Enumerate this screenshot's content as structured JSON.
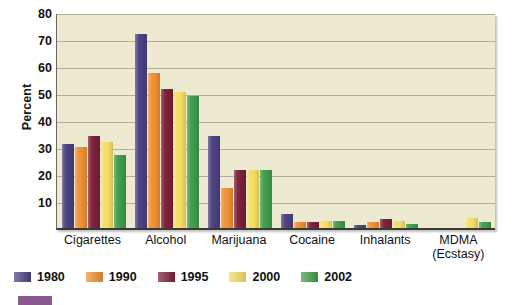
{
  "chart_data": {
    "type": "bar",
    "title": "",
    "subtitle": "",
    "xlabel": "",
    "ylabel": "Percent",
    "ylim": [
      0,
      80
    ],
    "yticks": [
      10,
      20,
      30,
      40,
      50,
      60,
      70,
      80
    ],
    "ytick_labels": [
      "10",
      "20",
      "30",
      "40",
      "50",
      "60",
      "70",
      "80"
    ],
    "grid": true,
    "legend_position": "bottom-left",
    "categories": [
      "Cigarettes",
      "Alcohol",
      "Marijuana",
      "Cocaine",
      "Inhalants",
      "MDMA (Ecstasy)"
    ],
    "category_labels": [
      {
        "line1": "Cigarettes",
        "line2": ""
      },
      {
        "line1": "Alcohol",
        "line2": ""
      },
      {
        "line1": "Marijuana",
        "line2": ""
      },
      {
        "line1": "Cocaine",
        "line2": ""
      },
      {
        "line1": "Inhalants",
        "line2": ""
      },
      {
        "line1": "MDMA",
        "line2": "(Ecstasy)"
      }
    ],
    "series": [
      {
        "name": "1980",
        "color": "#4b4080",
        "values": [
          31,
          72,
          34,
          5.2,
          1.2,
          null
        ]
      },
      {
        "name": "1990",
        "color": "#ef8f33",
        "values": [
          30,
          57.5,
          15,
          2.4,
          2.2,
          null
        ]
      },
      {
        "name": "1995",
        "color": "#7b1f38",
        "values": [
          34,
          51.5,
          21.5,
          2.2,
          3.2,
          null
        ]
      },
      {
        "name": "2000",
        "color": "#f5dc62",
        "values": [
          32,
          50.5,
          21.5,
          2.6,
          2.5,
          3.6
        ]
      },
      {
        "name": "2002",
        "color": "#3f9b49",
        "values": [
          27,
          49,
          21.5,
          2.5,
          1.5,
          2.4
        ]
      }
    ],
    "colors": {
      "plot_background": "#eeead2",
      "gridline": "#b3ae93",
      "axis": "#3b3a32",
      "text": "#111111"
    }
  },
  "legend": {
    "items": [
      {
        "label": "1980",
        "color": "#4b4080"
      },
      {
        "label": "1990",
        "color": "#ef8f33"
      },
      {
        "label": "1995",
        "color": "#7b1f38"
      },
      {
        "label": "2000",
        "color": "#f5dc62"
      },
      {
        "label": "2002",
        "color": "#3f9b49"
      }
    ]
  }
}
